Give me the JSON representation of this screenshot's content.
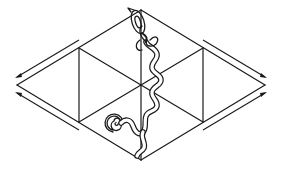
{
  "diagram": {
    "description": "Line drawing of a hexagonal isometric grid split into six triangles, with paired outward arrows along the four outer edges and a coiled tube-like figure running from a spiral at the bottom-left up to a looped head at the top vertex",
    "colors": {
      "stroke": "#1a1a1a",
      "background": "#ffffff"
    },
    "shape": {
      "type": "hexagon-grid",
      "vertices": {
        "top": [
          141,
          10
        ],
        "bottom": [
          141,
          160
        ],
        "left": [
          17,
          85
        ],
        "right": [
          265,
          85
        ],
        "upper_left": [
          79,
          48
        ],
        "lower_left": [
          79,
          122
        ],
        "upper_right": [
          203,
          48
        ],
        "lower_right": [
          203,
          122
        ],
        "center": [
          141,
          85
        ]
      }
    },
    "arrows": [
      {
        "id": "upper-left",
        "direction": "outward-left"
      },
      {
        "id": "lower-left",
        "direction": "outward-left"
      },
      {
        "id": "upper-right",
        "direction": "outward-right"
      },
      {
        "id": "lower-right",
        "direction": "outward-right"
      }
    ],
    "figure": {
      "name": "coiled-tube",
      "parts": [
        "spiral-base",
        "wavy-body",
        "looped-head"
      ]
    }
  }
}
